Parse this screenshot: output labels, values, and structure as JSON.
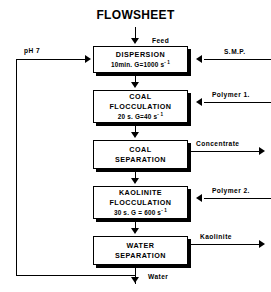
{
  "diagram": {
    "title": "FLOWSHEET",
    "units": [
      {
        "id": "dispersion",
        "name": "DISPERSION",
        "param": "10min.  G=1000  s",
        "param_exp": "- 1"
      },
      {
        "id": "coal-flocculation",
        "name_line1": "COAL",
        "name_line2": "FLOCCULATION",
        "param": "20 s.  G=40  s",
        "param_exp": "- 1"
      },
      {
        "id": "coal-separation",
        "name_line1": "COAL",
        "name_line2": "SEPARATION"
      },
      {
        "id": "kaolinite-flocculation",
        "name_line1": "KAOLINITE",
        "name_line2": "FLOCCULATION",
        "param": "30 s.  G = 600  s",
        "param_exp": "- 1"
      },
      {
        "id": "water-separation",
        "name_line1": "WATER",
        "name_line2": "SEPARATION"
      }
    ],
    "streams": {
      "feed": "Feed",
      "smp": "S.M.P.",
      "ph": "pH 7",
      "polymer1": "Polymer 1.",
      "polymer2": "Polymer 2.",
      "concentrate": "Concentrate",
      "kaolinite": "Kaolinite",
      "water": "Water"
    }
  }
}
